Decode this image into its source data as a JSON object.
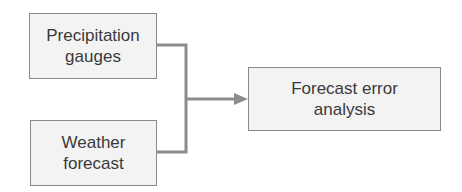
{
  "nodes": {
    "precipitation": {
      "line1": "Precipitation",
      "line2": "gauges"
    },
    "weather": {
      "line1": "Weather",
      "line2": "forecast"
    },
    "analysis": {
      "line1": "Forecast error",
      "line2": "analysis"
    }
  },
  "edges": [
    {
      "from": "precipitation",
      "to": "analysis"
    },
    {
      "from": "weather",
      "to": "analysis"
    }
  ],
  "colors": {
    "line": "#8c8c8c",
    "box_fill": "#f3f3f3",
    "box_border": "#8a8a8a",
    "text": "#3a3a3a"
  }
}
